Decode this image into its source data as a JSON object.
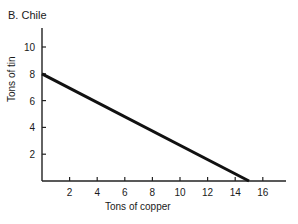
{
  "chart_data": {
    "type": "line",
    "title": "B. Chile",
    "xlabel": "Tons of copper",
    "ylabel": "Tons of tin",
    "x_ticks": [
      2,
      4,
      6,
      8,
      10,
      12,
      14,
      16
    ],
    "y_ticks": [
      2,
      4,
      6,
      8,
      10
    ],
    "xlim": [
      0,
      17.5
    ],
    "ylim": [
      0,
      11.5
    ],
    "grid": false,
    "legend": null,
    "series": [
      {
        "name": "Production possibilities frontier",
        "x": [
          0,
          15
        ],
        "y": [
          8,
          0
        ],
        "color": "#111111"
      }
    ]
  }
}
